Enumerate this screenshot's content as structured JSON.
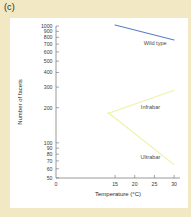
{
  "figure": {
    "panel_label": "(c)",
    "background_color": "#f2e9c4",
    "plot_background_color": "#ffffff"
  },
  "chart_data": {
    "type": "line",
    "title": "",
    "xlabel": "Temperature (°C)",
    "ylabel": "Number of facets",
    "xlim": [
      0,
      31.5
    ],
    "ylim": [
      50,
      1000
    ],
    "yscale": "log",
    "grid": false,
    "legend_position": "inline-labels",
    "xticks": [
      0,
      15,
      20,
      25,
      30
    ],
    "xtick_labels": [
      "0",
      "15",
      "20",
      "25",
      "30"
    ],
    "yticks": [
      50,
      60,
      70,
      80,
      90,
      100,
      200,
      300,
      400,
      500,
      600,
      700,
      800,
      900,
      1000
    ],
    "ytick_labels": [
      "50",
      "60",
      "70",
      "80",
      "90",
      "100",
      "200",
      "300",
      "400",
      "500",
      "600",
      "700",
      "800",
      "900",
      "1000"
    ],
    "x": [
      15,
      30
    ],
    "series": [
      {
        "name": "Wild type",
        "color": "#5b7fc4",
        "x": [
          15,
          30
        ],
        "values": [
          1020,
          760
        ],
        "label_x": 25.2,
        "label_y": 690
      },
      {
        "name": "Infrabar",
        "color": "#eef2a8",
        "x": [
          13.2,
          30
        ],
        "values": [
          178,
          282
        ],
        "label_x": 24.0,
        "label_y": 196
      },
      {
        "name": "Ultrabar",
        "color": "#eef2a8",
        "x": [
          13.2,
          30
        ],
        "values": [
          182,
          65
        ],
        "label_x": 24.0,
        "label_y": 72
      }
    ]
  }
}
